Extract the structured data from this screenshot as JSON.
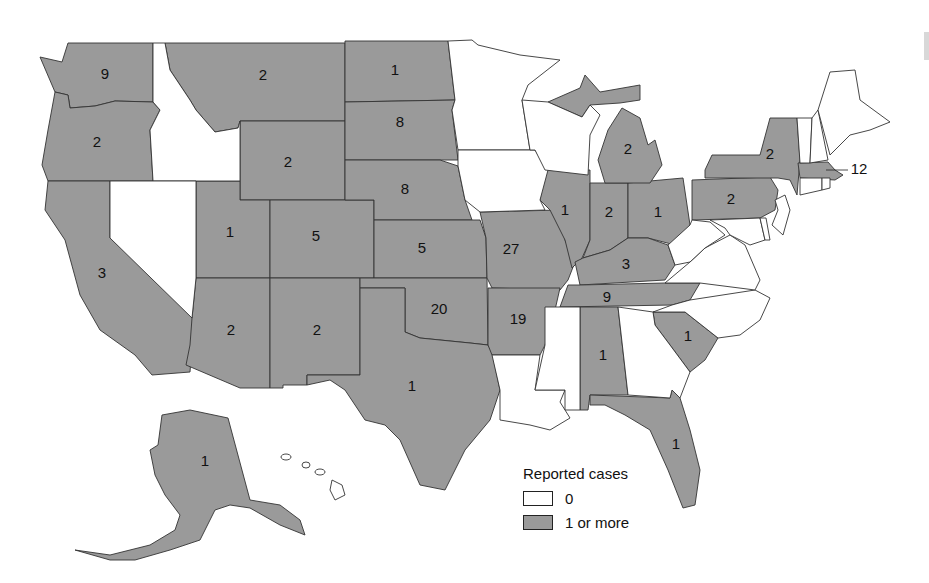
{
  "map": {
    "title": "",
    "colors": {
      "zero": "#ffffff",
      "one_or_more": "#9a9a9a",
      "border": "#333333"
    },
    "states": [
      {
        "id": "WA",
        "name": "Washington",
        "cases": 9,
        "label": "9"
      },
      {
        "id": "OR",
        "name": "Oregon",
        "cases": 2,
        "label": "2"
      },
      {
        "id": "CA",
        "name": "California",
        "cases": 3,
        "label": "3"
      },
      {
        "id": "ID",
        "name": "Idaho",
        "cases": 0,
        "label": ""
      },
      {
        "id": "NV",
        "name": "Nevada",
        "cases": 0,
        "label": ""
      },
      {
        "id": "MT",
        "name": "Montana",
        "cases": 2,
        "label": "2"
      },
      {
        "id": "WY",
        "name": "Wyoming",
        "cases": 2,
        "label": "2"
      },
      {
        "id": "UT",
        "name": "Utah",
        "cases": 1,
        "label": "1"
      },
      {
        "id": "CO",
        "name": "Colorado",
        "cases": 5,
        "label": "5"
      },
      {
        "id": "AZ",
        "name": "Arizona",
        "cases": 2,
        "label": "2"
      },
      {
        "id": "NM",
        "name": "New Mexico",
        "cases": 2,
        "label": "2"
      },
      {
        "id": "ND",
        "name": "North Dakota",
        "cases": 1,
        "label": "1"
      },
      {
        "id": "SD",
        "name": "South Dakota",
        "cases": 8,
        "label": "8"
      },
      {
        "id": "NE",
        "name": "Nebraska",
        "cases": 8,
        "label": "8"
      },
      {
        "id": "KS",
        "name": "Kansas",
        "cases": 5,
        "label": "5"
      },
      {
        "id": "OK",
        "name": "Oklahoma",
        "cases": 20,
        "label": "20"
      },
      {
        "id": "TX",
        "name": "Texas",
        "cases": 1,
        "label": "1"
      },
      {
        "id": "MN",
        "name": "Minnesota",
        "cases": 0,
        "label": ""
      },
      {
        "id": "IA",
        "name": "Iowa",
        "cases": 0,
        "label": ""
      },
      {
        "id": "MO",
        "name": "Missouri",
        "cases": 27,
        "label": "27"
      },
      {
        "id": "AR",
        "name": "Arkansas",
        "cases": 19,
        "label": "19"
      },
      {
        "id": "LA",
        "name": "Louisiana",
        "cases": 0,
        "label": ""
      },
      {
        "id": "WI",
        "name": "Wisconsin",
        "cases": 0,
        "label": ""
      },
      {
        "id": "IL",
        "name": "Illinois",
        "cases": 1,
        "label": "1"
      },
      {
        "id": "MI",
        "name": "Michigan",
        "cases": 2,
        "label": "2"
      },
      {
        "id": "IN",
        "name": "Indiana",
        "cases": 2,
        "label": "2"
      },
      {
        "id": "OH",
        "name": "Ohio",
        "cases": 1,
        "label": "1"
      },
      {
        "id": "KY",
        "name": "Kentucky",
        "cases": 3,
        "label": "3"
      },
      {
        "id": "TN",
        "name": "Tennessee",
        "cases": 9,
        "label": "9"
      },
      {
        "id": "MS",
        "name": "Mississippi",
        "cases": 0,
        "label": ""
      },
      {
        "id": "AL",
        "name": "Alabama",
        "cases": 1,
        "label": "1"
      },
      {
        "id": "GA",
        "name": "Georgia",
        "cases": 0,
        "label": ""
      },
      {
        "id": "FL",
        "name": "Florida",
        "cases": 1,
        "label": "1"
      },
      {
        "id": "SC",
        "name": "South Carolina",
        "cases": 1,
        "label": "1"
      },
      {
        "id": "NC",
        "name": "North Carolina",
        "cases": 0,
        "label": ""
      },
      {
        "id": "VA",
        "name": "Virginia",
        "cases": 0,
        "label": ""
      },
      {
        "id": "WV",
        "name": "West Virginia",
        "cases": 0,
        "label": ""
      },
      {
        "id": "PA",
        "name": "Pennsylvania",
        "cases": 2,
        "label": "2"
      },
      {
        "id": "NY",
        "name": "New York",
        "cases": 2,
        "label": "2"
      },
      {
        "id": "NJ",
        "name": "New Jersey",
        "cases": 0,
        "label": ""
      },
      {
        "id": "MD",
        "name": "Maryland",
        "cases": 0,
        "label": ""
      },
      {
        "id": "DE",
        "name": "Delaware",
        "cases": 0,
        "label": ""
      },
      {
        "id": "CT",
        "name": "Connecticut",
        "cases": 0,
        "label": ""
      },
      {
        "id": "RI",
        "name": "Rhode Island",
        "cases": 0,
        "label": ""
      },
      {
        "id": "MA",
        "name": "Massachusetts",
        "cases": 12,
        "label": "12"
      },
      {
        "id": "VT",
        "name": "Vermont",
        "cases": 0,
        "label": ""
      },
      {
        "id": "NH",
        "name": "New Hampshire",
        "cases": 0,
        "label": ""
      },
      {
        "id": "ME",
        "name": "Maine",
        "cases": 0,
        "label": ""
      },
      {
        "id": "AK",
        "name": "Alaska",
        "cases": 1,
        "label": "1"
      },
      {
        "id": "HI",
        "name": "Hawaii",
        "cases": 0,
        "label": ""
      }
    ]
  },
  "labels": {
    "WA": "9",
    "OR": "2",
    "CA": "3",
    "MT": "2",
    "WY": "2",
    "UT": "1",
    "CO": "5",
    "AZ": "2",
    "NM": "2",
    "ND": "1",
    "SD": "8",
    "NE": "8",
    "KS": "5",
    "OK": "20",
    "TX": "1",
    "MO": "27",
    "AR": "19",
    "IL": "1",
    "MI": "2",
    "IN": "2",
    "OH": "1",
    "KY": "3",
    "TN": "9",
    "AL": "1",
    "FL": "1",
    "SC": "1",
    "PA": "2",
    "NY": "2",
    "MA": "12",
    "AK": "1"
  },
  "legend": {
    "title": "Reported cases",
    "items": [
      {
        "label": "0",
        "color": "#ffffff"
      },
      {
        "label": "1 or more",
        "color": "#9a9a9a"
      }
    ]
  }
}
